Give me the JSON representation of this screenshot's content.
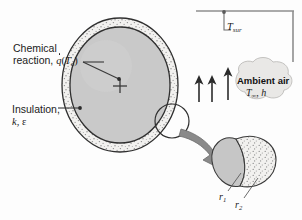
{
  "figure": {
    "name": "insulated-sphere-heat-transfer-schematic",
    "width": 302,
    "height": 220,
    "background_color": "#fdfdfd"
  },
  "labels": {
    "chemical_reaction_line1": "Chemical",
    "chemical_reaction_line2_prefix": "reaction, ",
    "chemical_reaction_symbol": "q",
    "chemical_reaction_arg_open": "(",
    "chemical_reaction_arg_symbol": "T",
    "chemical_reaction_arg_sub": "o",
    "chemical_reaction_arg_close": ")",
    "insulation_line1": "Insulation,",
    "insulation_symbol_k": "k",
    "insulation_comma": ", ",
    "insulation_symbol_eps": "ε",
    "surroundings_symbol": "T",
    "surroundings_sub": "sur",
    "ambient_title": "Ambient air",
    "ambient_symbol_T": "T",
    "ambient_sub": "∞",
    "ambient_comma": ", ",
    "ambient_symbol_h": "h",
    "radius_inner_symbol": "r",
    "radius_inner_sub": "1",
    "radius_outer_symbol": "r",
    "radius_outer_sub": "2"
  },
  "geometry": {
    "sphere_center_x": 120,
    "sphere_center_y": 85,
    "sphere_outer_rx": 58,
    "sphere_outer_ry": 67,
    "sphere_inner_rx": 50,
    "sphere_inner_ry": 58,
    "detail_circle_x": 172,
    "detail_circle_y": 121,
    "detail_circle_r": 17
  },
  "colors": {
    "core_fill": "#c9c9c9",
    "insulation_fill": "#f0efed",
    "speckle": "#8d8d8d",
    "outline": "#2f2f2f",
    "arrow_gray": "#8a8a8a",
    "boundary_line": "#8e8e8e",
    "cloud_fill": "#e9e8e6",
    "text": "#1b1b1b"
  },
  "icons": {
    "convection_arrow_left": "up-arrow-icon",
    "convection_arrow_right": "up-arrow-icon",
    "radiation_arrow": "up-arrow-icon",
    "magnify_arrow": "curved-right-arrow-icon",
    "center_mark": "center-cross-icon"
  }
}
